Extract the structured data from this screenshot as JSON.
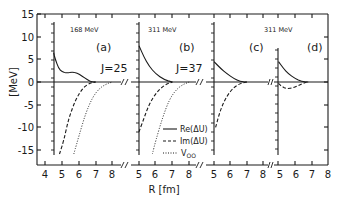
{
  "chart_data": {
    "type": "line",
    "title": "",
    "ylabel": "[MeV]",
    "xlabel": "R [fm]",
    "ylim": [
      -19,
      15
    ],
    "yticks": [
      15,
      10,
      5,
      0,
      -5,
      -10,
      -15
    ],
    "grid": false,
    "legend": {
      "position": "inside panel (b), lower right",
      "entries": [
        "Re(ΔU)",
        "Im(ΔU)",
        "V_OO"
      ],
      "styles": [
        "solid",
        "dashed",
        "dotted"
      ]
    },
    "panels": [
      {
        "label": "(a)",
        "energy": "168 MeV",
        "J": "J=25",
        "xlim": [
          3.5,
          8.5
        ],
        "xticks": [
          4,
          5,
          6,
          7,
          8
        ],
        "series": [
          {
            "name": "Re(ΔU)",
            "style": "solid",
            "x": [
              4.5,
              4.6,
              4.8,
              5.0,
              5.3,
              5.6,
              5.9,
              6.2,
              6.5,
              6.8,
              7.0
            ],
            "y": [
              6.5,
              5.0,
              3.0,
              2.2,
              2.0,
              2.2,
              2.0,
              1.3,
              0.5,
              0.0,
              0.0
            ]
          },
          {
            "name": "Im(ΔU)",
            "style": "dashed",
            "x": [
              4.85,
              5.1,
              5.4,
              5.8,
              6.2,
              6.6,
              7.0
            ],
            "y": [
              -18,
              -13,
              -8,
              -4,
              -1.5,
              -0.3,
              0
            ]
          },
          {
            "name": "V_OO",
            "style": "dotted",
            "x": [
              5.7,
              6.0,
              6.4,
              6.8,
              7.2,
              7.6,
              8.0
            ],
            "y": [
              -18,
              -12,
              -7,
              -3.5,
              -1.5,
              -0.5,
              0
            ]
          }
        ]
      },
      {
        "label": "(b)",
        "energy": "311 MeV",
        "J": "J=37",
        "xlim": [
          4.7,
          8.4
        ],
        "xticks": [
          5,
          6,
          7,
          8
        ],
        "series": [
          {
            "name": "Re(ΔU)",
            "style": "solid",
            "x": [
              5.0,
              5.3,
              5.6,
              6.0,
              6.5,
              7.0
            ],
            "y": [
              8.0,
              5.5,
              3.5,
              1.8,
              0.5,
              0.0
            ]
          },
          {
            "name": "Im(ΔU)",
            "style": "dashed",
            "x": [
              5.0,
              5.3,
              5.6,
              6.0,
              6.5,
              7.0
            ],
            "y": [
              -11,
              -8,
              -5,
              -2.5,
              -0.7,
              0
            ]
          },
          {
            "name": "V_OO",
            "style": "dotted",
            "x": [
              5.8,
              6.0,
              6.4,
              6.8,
              7.2,
              7.6,
              8.0
            ],
            "y": [
              -18,
              -13,
              -8,
              -4,
              -1.8,
              -0.6,
              0
            ]
          }
        ]
      },
      {
        "label": "(c)",
        "energy": "311 MeV",
        "J": "",
        "xlim": [
          4.7,
          8.4
        ],
        "xticks": [
          5,
          6,
          7,
          8
        ],
        "series": [
          {
            "name": "Re(ΔU)",
            "style": "solid",
            "x": [
              5.0,
              5.4,
              5.8,
              6.2,
              6.6,
              7.0
            ],
            "y": [
              4.5,
              3.0,
              1.8,
              0.8,
              0.1,
              0.0
            ]
          },
          {
            "name": "Im(ΔU)",
            "style": "dashed",
            "x": [
              5.1,
              5.4,
              5.8,
              6.2,
              6.6,
              7.0
            ],
            "y": [
              -10,
              -6,
              -3,
              -1.2,
              -0.3,
              0
            ]
          }
        ]
      },
      {
        "label": "(d)",
        "energy": "",
        "J": "",
        "xlim": [
          4.7,
          8.5
        ],
        "xticks": [
          5,
          6,
          7,
          8
        ],
        "series": [
          {
            "name": "Re(ΔU)",
            "style": "solid",
            "x": [
              5.0,
              5.3,
              5.6,
              6.0,
              6.4,
              6.8
            ],
            "y": [
              4.5,
              3.0,
              1.8,
              0.8,
              0.1,
              0.0
            ]
          },
          {
            "name": "Im(ΔU)",
            "style": "dashed",
            "x": [
              5.0,
              5.2,
              5.5,
              5.9,
              6.3,
              6.7
            ],
            "y": [
              -0.3,
              -1.0,
              -1.5,
              -1.3,
              -0.6,
              0
            ]
          }
        ]
      }
    ]
  },
  "labels": {
    "ylabel": "[MeV]",
    "xlabel": "R [fm]",
    "energy_a": "168 MeV",
    "energy_b": "311 MeV",
    "energy_c": "311 MeV",
    "panel_a": "(a)",
    "panel_b": "(b)",
    "panel_c": "(c)",
    "panel_d": "(d)",
    "j_a": "J=25",
    "j_b": "J=37",
    "legend_re": "Re(ΔU)",
    "legend_im": "Im(ΔU)",
    "legend_v": "V",
    "legend_v_sub": "OO"
  },
  "ticks": {
    "y": [
      "15",
      "10",
      "5",
      "0",
      "-5",
      "-10",
      "-15"
    ],
    "xa": [
      "4",
      "5",
      "6",
      "7",
      "8"
    ],
    "xb": [
      "5",
      "6",
      "7",
      "8"
    ],
    "xc": [
      "5",
      "6",
      "7",
      "8"
    ],
    "xd": [
      "5",
      "6",
      "7",
      "8"
    ]
  }
}
